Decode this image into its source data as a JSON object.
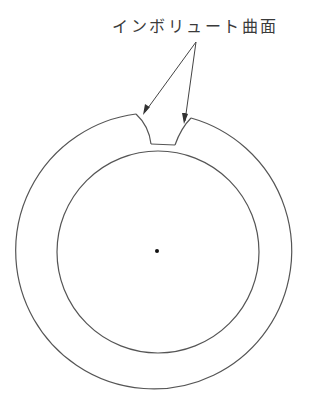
{
  "diagram": {
    "label": "インボリュート曲面",
    "stroke_color": "#555555",
    "center": {
      "x": 157,
      "y": 252
    },
    "outer_radius": 138,
    "inner_radius": 102
  }
}
